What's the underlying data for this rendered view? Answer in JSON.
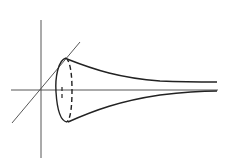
{
  "diagram": {
    "background": "#ffffff",
    "stroke_color": "#222222",
    "axes": {
      "vertical": {
        "x1": 41,
        "y1": 20,
        "x2": 41,
        "y2": 158
      },
      "horizontal": {
        "x1": 11,
        "y1": 90,
        "x2": 218,
        "y2": 90
      },
      "diagonal": {
        "x1": 12,
        "y1": 123,
        "x2": 80,
        "y2": 42
      }
    },
    "opening_ellipse": {
      "cx": 64,
      "cy": 90,
      "rx": 8,
      "ry": 32
    },
    "labels": []
  }
}
